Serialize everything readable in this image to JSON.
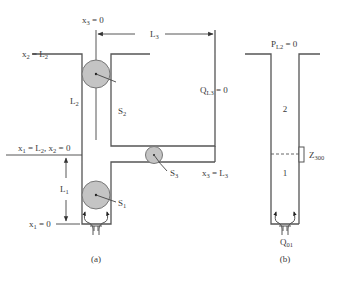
{
  "figure": {
    "panel_a": {
      "caption": "(a)",
      "labels": {
        "x3_zero": "x",
        "x3_zero_sub": "3",
        "x3_zero_val": " = 0",
        "x2_L2": "x",
        "x2_L2_sub": "2",
        "x2_L2_mid": " = L",
        "x2_L2_sub2": "2",
        "L3": "L",
        "L3_sub": "3",
        "L2": "L",
        "L2_sub": "2",
        "S2": "S",
        "S2_sub": "2",
        "QL3": "Q",
        "QL3_sub": "L3",
        "QL3_val": " = 0",
        "x1_L2_x2_0_a": "x",
        "x1_L2_x2_0_a_sub": "1",
        "x1_L2_x2_0_b": " = L",
        "x1_L2_x2_0_b_sub": "2",
        "x1_L2_x2_0_c": ", x",
        "x1_L2_x2_0_c_sub": "2",
        "x1_L2_x2_0_d": " = 0",
        "L1": "L",
        "L1_sub": "1",
        "S1": "S",
        "S1_sub": "1",
        "S3": "S",
        "S3_sub": "3",
        "x3_L3": "x",
        "x3_L3_sub": "3",
        "x3_L3_mid": " = L",
        "x3_L3_sub2": "3",
        "x1_zero": "x",
        "x1_zero_sub": "1",
        "x1_zero_val": " = 0"
      }
    },
    "panel_b": {
      "caption": "(b)",
      "labels": {
        "PL2": "P",
        "PL2_sub": "L2",
        "PL2_val": " = 0",
        "zone_upper": "2",
        "zone_lower": "1",
        "Z": "Z",
        "Z_sub": "300",
        "Q": "Q",
        "Q_sub": "01"
      }
    },
    "colors": {
      "line": "#555555",
      "sphere_fill": "#c4c4c4",
      "text": "#3a3a3a"
    }
  }
}
